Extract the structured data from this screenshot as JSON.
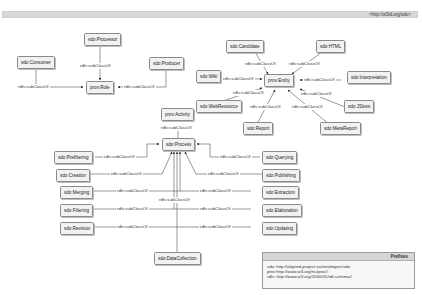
{
  "header": {
    "namespace": "<http://w3id.org/sdo>"
  },
  "edge_label": "rdfs:subClassOf",
  "nodes": {
    "processor": "sdo:Processor",
    "consumer": "sdo:Consumer",
    "producer": "sdo:Producer",
    "role": "prov:Role",
    "candidate": "sdo:Candidate",
    "html": "sdo:HTML",
    "wiki": "sdo:Wiki",
    "entity": "prov:Entity",
    "interpretation": "sdo:Interpretation",
    "webresource": "sdo:WebResource",
    "jsloss": "sdo:JSloss",
    "report": "sdo:Report",
    "metareport": "sdo:MetaReport",
    "activity": "prov:Activity",
    "process": "sdo:Process",
    "prefiltering": "sdo:Prefiltering",
    "creation": "sdo:Creation",
    "merging": "sdo:Merging",
    "filtering": "sdo:Filtering",
    "revision": "sdo:Revision",
    "querying": "sdo:Querying",
    "publishing": "sdo:Publishing",
    "extraction": "sdo:Extraction",
    "elaboration": "sdo:Elaboration",
    "updating": "sdo:Updating",
    "datacollection": "sdo:DataCollection"
  },
  "prefixes": {
    "title": "Prefixes",
    "lines": [
      "sdo: http://aligned-project.eu/ontologies/sdo",
      "prov:http://www.w3.org/ns/prov#",
      "rdfs: http://www.w3.org/2000/01/rdf-schema#"
    ]
  }
}
